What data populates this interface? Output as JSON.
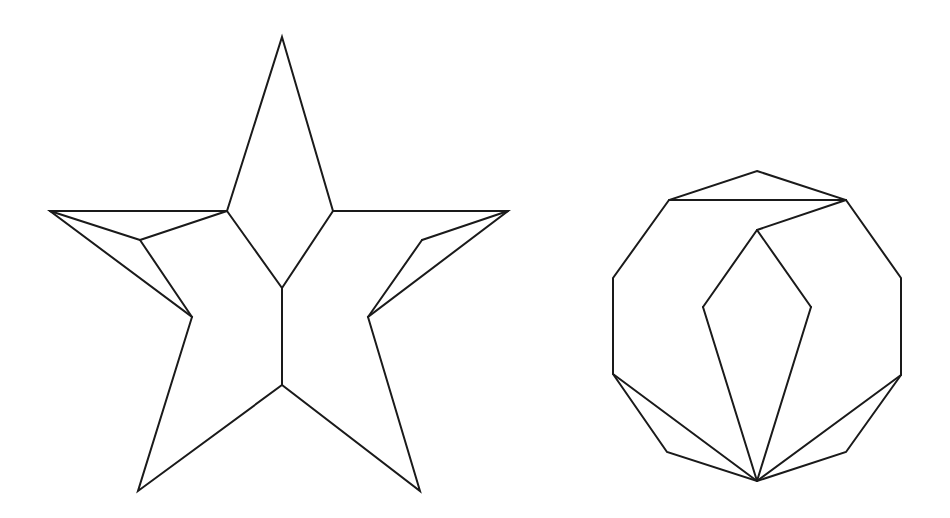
{
  "diagram": {
    "background": "#ffffff",
    "stroke_color": "#1a1a1a",
    "stroke_width": 2,
    "shapes": [
      {
        "name": "star-dissection",
        "outline": [
          [
            282,
            37
          ],
          [
            333,
            211
          ],
          [
            508,
            211
          ],
          [
            368,
            317
          ],
          [
            420,
            491
          ],
          [
            282,
            385
          ],
          [
            138,
            491
          ],
          [
            192,
            317
          ],
          [
            50,
            211
          ],
          [
            227,
            211
          ]
        ],
        "segments": [
          [
            [
              227,
              211
            ],
            [
              282,
              288
            ]
          ],
          [
            [
              333,
              211
            ],
            [
              282,
              288
            ]
          ],
          [
            [
              282,
              288
            ],
            [
              282,
              385
            ]
          ],
          [
            [
              50,
              211
            ],
            [
              140,
              240
            ]
          ],
          [
            [
              140,
              240
            ],
            [
              227,
              211
            ]
          ],
          [
            [
              140,
              240
            ],
            [
              192,
              317
            ]
          ],
          [
            [
              508,
              211
            ],
            [
              422,
              240
            ]
          ],
          [
            [
              422,
              240
            ],
            [
              368,
              317
            ]
          ]
        ]
      },
      {
        "name": "decagon-dissection",
        "outline": [
          [
            757,
            171
          ],
          [
            846,
            200
          ],
          [
            901,
            278
          ],
          [
            901,
            375
          ],
          [
            846,
            452
          ],
          [
            757,
            481
          ],
          [
            667,
            452
          ],
          [
            613,
            374
          ],
          [
            613,
            278
          ],
          [
            669,
            200
          ]
        ],
        "segments": [
          [
            [
              669,
              200
            ],
            [
              846,
              200
            ]
          ],
          [
            [
              846,
              200
            ],
            [
              757,
              230
            ]
          ],
          [
            [
              757,
              230
            ],
            [
              703,
              307
            ]
          ],
          [
            [
              757,
              230
            ],
            [
              811,
              307
            ]
          ],
          [
            [
              703,
              307
            ],
            [
              757,
              481
            ]
          ],
          [
            [
              811,
              307
            ],
            [
              757,
              481
            ]
          ],
          [
            [
              613,
              374
            ],
            [
              757,
              481
            ]
          ],
          [
            [
              901,
              375
            ],
            [
              757,
              481
            ]
          ]
        ]
      }
    ]
  }
}
